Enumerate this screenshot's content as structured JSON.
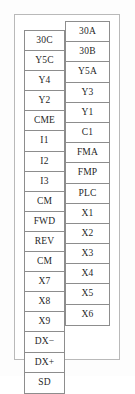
{
  "diagram": {
    "name": "terminal-block-layout",
    "frame": {
      "border_color": "#b9b9b9",
      "background": "#ffffff"
    },
    "cell_border_color": "#8d8d8d",
    "text_color": "#1f1f1f",
    "left_column": {
      "name": "left-terminal-column",
      "terminals": [
        {
          "label": "30C"
        },
        {
          "label": "Y5C"
        },
        {
          "label": "Y4"
        },
        {
          "label": "Y2"
        },
        {
          "label": "CME"
        },
        {
          "label": "I1"
        },
        {
          "label": "I2"
        },
        {
          "label": "I3"
        },
        {
          "label": "CM"
        },
        {
          "label": "FWD"
        },
        {
          "label": "REV"
        },
        {
          "label": "CM"
        },
        {
          "label": "X7"
        },
        {
          "label": "X8"
        },
        {
          "label": "X9"
        },
        {
          "label": "DX−"
        },
        {
          "label": "DX+"
        },
        {
          "label": "SD"
        }
      ]
    },
    "right_column": {
      "name": "right-terminal-column",
      "terminals": [
        {
          "label": "30A"
        },
        {
          "label": "30B"
        },
        {
          "label": "Y5A"
        },
        {
          "label": "Y3"
        },
        {
          "label": "Y1"
        },
        {
          "label": "C1"
        },
        {
          "label": "FMA"
        },
        {
          "label": "FMP"
        },
        {
          "label": "PLC"
        },
        {
          "label": "X1"
        },
        {
          "label": "X2"
        },
        {
          "label": "X3"
        },
        {
          "label": "X4"
        },
        {
          "label": "X5"
        },
        {
          "label": "X6"
        }
      ]
    }
  }
}
